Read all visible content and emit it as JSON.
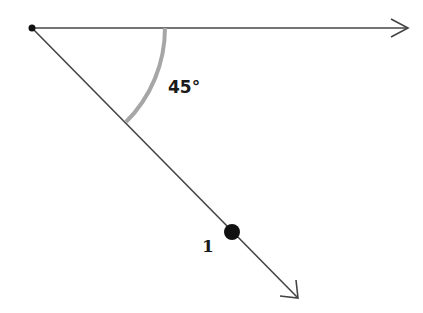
{
  "diagram": {
    "title": "",
    "angle_label": "45°",
    "point_label": "1",
    "origin": {
      "x": 32,
      "y": 28
    },
    "horizontal_ray": {
      "end_x": 408,
      "end_y": 28
    },
    "diagonal_ray": {
      "end_x": 298,
      "end_y": 298
    },
    "arc": {
      "radius": 133,
      "color": "#a6a6a6",
      "width": 4
    },
    "point": {
      "x": 232,
      "y": 232,
      "r": 8
    },
    "colors": {
      "line": "#333333",
      "dot": "#111111",
      "arc": "#a6a6a6"
    }
  }
}
